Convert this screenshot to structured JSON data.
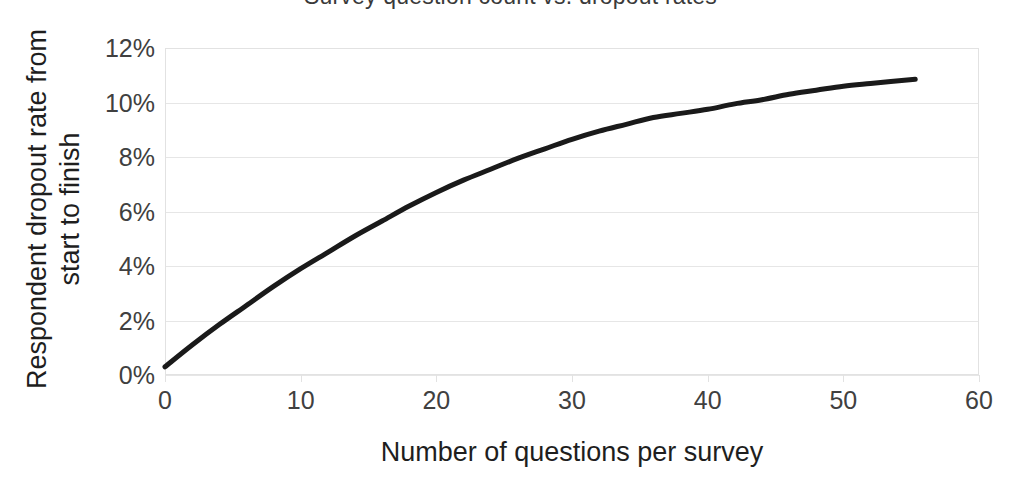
{
  "chart_data": {
    "type": "line",
    "title": "Survey question count vs. dropout rates",
    "xlabel": "Number of questions per survey",
    "ylabel": "Respondent dropout rate from start to finish",
    "ylabel_line1": "Respondent dropout rate from",
    "ylabel_line2": "start to finish",
    "xlim": [
      0,
      60
    ],
    "ylim": [
      0,
      12
    ],
    "x_ticks": [
      0,
      10,
      20,
      30,
      40,
      50,
      60
    ],
    "x_tick_labels": [
      "0",
      "10",
      "20",
      "30",
      "40",
      "50",
      "60"
    ],
    "y_ticks": [
      0,
      2,
      4,
      6,
      8,
      10,
      12
    ],
    "y_tick_labels": [
      "0%",
      "2%",
      "4%",
      "6%",
      "8%",
      "10%",
      "12%"
    ],
    "grid": "horizontal",
    "legend": "none",
    "series": [
      {
        "name": "Dropout rate",
        "color": "#1a1a1a",
        "line_width": 5,
        "x": [
          0,
          2,
          4,
          6,
          8,
          10,
          12,
          14,
          16,
          18,
          20,
          22,
          24,
          26,
          28,
          30,
          32,
          34,
          36,
          38,
          40,
          42,
          44,
          46,
          48,
          50,
          52,
          55.3
        ],
        "values": [
          0.3,
          1.1,
          1.85,
          2.55,
          3.25,
          3.9,
          4.5,
          5.1,
          5.65,
          6.2,
          6.7,
          7.15,
          7.55,
          7.95,
          8.3,
          8.65,
          8.95,
          9.2,
          9.45,
          9.6,
          9.75,
          9.95,
          10.1,
          10.3,
          10.45,
          10.6,
          10.7,
          10.85
        ]
      }
    ]
  },
  "figure": {
    "background_color": "#ffffff",
    "grid_color": "#e6e6e6",
    "axis_color": "#e2e2e2",
    "tick_label_color": "#404040",
    "axis_title_color": "#1e1e1e"
  }
}
